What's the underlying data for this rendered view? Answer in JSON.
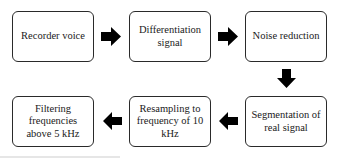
{
  "diagram": {
    "type": "flowchart",
    "steps": [
      {
        "id": 1,
        "label": "Recorder voice"
      },
      {
        "id": 2,
        "label": "Differentiation signal"
      },
      {
        "id": 3,
        "label": "Noise reduction"
      },
      {
        "id": 4,
        "label": "Segmentation of real signal"
      },
      {
        "id": 5,
        "label": "Resampling to frequency of 10 kHz"
      },
      {
        "id": 6,
        "label": "Filtering frequencies above 5 kHz"
      }
    ],
    "edges": [
      {
        "from": 1,
        "to": 2,
        "direction": "right"
      },
      {
        "from": 2,
        "to": 3,
        "direction": "right"
      },
      {
        "from": 3,
        "to": 4,
        "direction": "down"
      },
      {
        "from": 4,
        "to": 5,
        "direction": "left"
      },
      {
        "from": 5,
        "to": 6,
        "direction": "left"
      }
    ],
    "colors": {
      "box_border": "#2a2a2a",
      "arrow": "#000000",
      "text": "#1a1a1a"
    }
  }
}
